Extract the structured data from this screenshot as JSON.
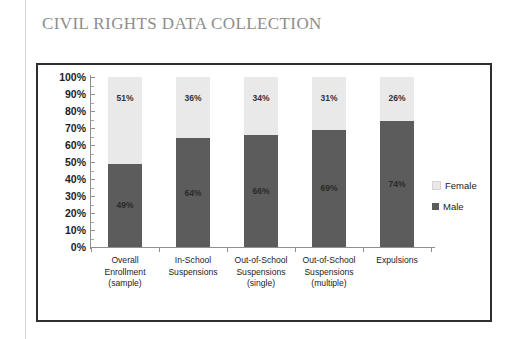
{
  "document": {
    "title": "CIVIL RIGHTS DATA COLLECTION"
  },
  "colors": {
    "female": "#e9e9e9",
    "male": "#5c5c5c",
    "frame_border": "#2e2e2e",
    "axis": "#8f8f8f",
    "title_text": "#8d8d8d",
    "label_text": "#1d1d1d"
  },
  "chart_data": {
    "type": "bar",
    "subtype": "stacked-100-percent",
    "title": "",
    "xlabel": "",
    "ylabel": "",
    "ylim": [
      0,
      100
    ],
    "y_tick_labels": [
      "100%",
      "90%",
      "80%",
      "70%",
      "60%",
      "50%",
      "40%",
      "30%",
      "20%",
      "10%",
      "0%"
    ],
    "y_tick_values": [
      100,
      90,
      80,
      70,
      60,
      50,
      40,
      30,
      20,
      10,
      0
    ],
    "grid": false,
    "legend_position": "right",
    "categories": [
      "Overall Enrollment (sample)",
      "In-School Suspensions",
      "Out-of-School Suspensions (single)",
      "Out-of-School Suspensions (multiple)",
      "Expulsions"
    ],
    "category_lines": [
      [
        "Overall",
        "Enrollment",
        "(sample)"
      ],
      [
        "In-School",
        "Suspensions"
      ],
      [
        "Out-of-School",
        "Suspensions",
        "(single)"
      ],
      [
        "Out-of-School",
        "Suspensions",
        "(multiple)"
      ],
      [
        "Expulsions"
      ]
    ],
    "series": [
      {
        "name": "Male",
        "color": "#5c5c5c",
        "values": [
          49,
          64,
          66,
          69,
          74
        ],
        "labels": [
          "49%",
          "64%",
          "66%",
          "69%",
          "74%"
        ]
      },
      {
        "name": "Female",
        "color": "#e9e9e9",
        "values": [
          51,
          36,
          34,
          31,
          26
        ],
        "labels": [
          "51%",
          "36%",
          "34%",
          "31%",
          "26%"
        ]
      }
    ],
    "legend": [
      {
        "label": "Female",
        "color": "#e9e9e9"
      },
      {
        "label": "Male",
        "color": "#5c5c5c"
      }
    ]
  }
}
